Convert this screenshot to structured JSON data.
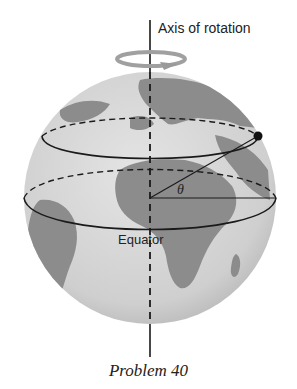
{
  "figure": {
    "axis_label": "Axis of rotation",
    "equator_label": "Equator",
    "angle_label": "θ",
    "caption": "Problem 40"
  },
  "colors": {
    "ocean": "#d4d4d4",
    "land": "#8c8c8c",
    "lines": "#1a1a1a",
    "rotation_arrow": "#9a9a9a"
  },
  "icons": {
    "rotation_arrow": "rotation-arrow-icon",
    "point_marker": "point-marker-icon"
  }
}
